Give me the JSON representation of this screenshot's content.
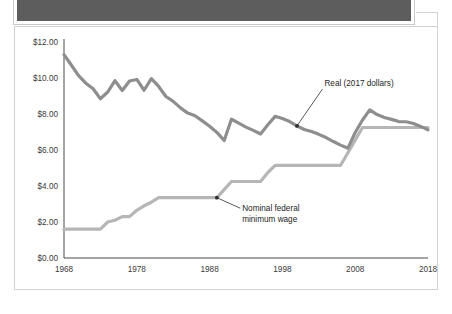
{
  "banner": {
    "name": "top-banner",
    "fill_color": "#5d5d5d",
    "border_color": "#ffffff"
  },
  "chart_data": {
    "type": "line",
    "title": "",
    "xlabel": "",
    "ylabel": "",
    "grid": false,
    "legend_position": "inline-annotations",
    "xlim": [
      1968,
      2018
    ],
    "ylim": [
      0,
      12
    ],
    "x_ticks": [
      1968,
      1978,
      1988,
      1998,
      2008,
      2018
    ],
    "x_tick_labels": [
      "1968",
      "1978",
      "1988",
      "1998",
      "2008",
      "2018"
    ],
    "y_ticks": [
      0,
      2,
      4,
      6,
      8,
      10,
      12
    ],
    "y_tick_labels": [
      "$0.00",
      "$2.00",
      "$4.00",
      "$6.00",
      "$8.00",
      "$10.00",
      "$12.00"
    ],
    "series": [
      {
        "name": "Real (2017 dollars)",
        "color": "#8e8e8e",
        "x": [
          1968,
          1969,
          1970,
          1971,
          1972,
          1973,
          1974,
          1975,
          1976,
          1977,
          1978,
          1979,
          1980,
          1981,
          1982,
          1983,
          1984,
          1985,
          1986,
          1987,
          1988,
          1989,
          1990,
          1991,
          1992,
          1993,
          1994,
          1995,
          1996,
          1997,
          1998,
          1999,
          2000,
          2001,
          2002,
          2003,
          2004,
          2005,
          2006,
          2007,
          2008,
          2009,
          2010,
          2011,
          2012,
          2013,
          2014,
          2015,
          2016,
          2017,
          2018
        ],
        "values": [
          11.3,
          10.72,
          10.13,
          9.71,
          9.4,
          8.85,
          9.22,
          9.85,
          9.31,
          9.83,
          9.92,
          9.32,
          9.96,
          9.53,
          8.97,
          8.7,
          8.34,
          8.05,
          7.9,
          7.62,
          7.32,
          6.98,
          6.53,
          7.71,
          7.49,
          7.27,
          7.09,
          6.89,
          7.4,
          7.87,
          7.75,
          7.58,
          7.34,
          7.14,
          7.03,
          6.87,
          6.69,
          6.47,
          6.27,
          6.1,
          6.97,
          7.67,
          8.23,
          7.97,
          7.81,
          7.7,
          7.58,
          7.57,
          7.47,
          7.31,
          7.12
        ]
      },
      {
        "name": "Nominal federal minimum wage",
        "color": "#b6b6b6",
        "x": [
          1968,
          1969,
          1970,
          1971,
          1972,
          1973,
          1974,
          1975,
          1976,
          1977,
          1978,
          1979,
          1980,
          1981,
          1982,
          1983,
          1984,
          1985,
          1986,
          1987,
          1988,
          1989,
          1990,
          1991,
          1992,
          1993,
          1994,
          1995,
          1996,
          1997,
          1998,
          1999,
          2000,
          2001,
          2002,
          2003,
          2004,
          2005,
          2006,
          2007,
          2008,
          2009,
          2010,
          2011,
          2012,
          2013,
          2014,
          2015,
          2016,
          2017,
          2018
        ],
        "values": [
          1.6,
          1.6,
          1.6,
          1.6,
          1.6,
          1.6,
          2.0,
          2.1,
          2.3,
          2.3,
          2.65,
          2.9,
          3.1,
          3.35,
          3.35,
          3.35,
          3.35,
          3.35,
          3.35,
          3.35,
          3.35,
          3.35,
          3.8,
          4.25,
          4.25,
          4.25,
          4.25,
          4.25,
          4.75,
          5.15,
          5.15,
          5.15,
          5.15,
          5.15,
          5.15,
          5.15,
          5.15,
          5.15,
          5.15,
          5.85,
          6.55,
          7.25,
          7.25,
          7.25,
          7.25,
          7.25,
          7.25,
          7.25,
          7.25,
          7.25,
          7.25
        ]
      }
    ],
    "annotations": [
      {
        "name": "real-series-annotation",
        "text": "Real (2017 dollars)",
        "point_x": 2000,
        "point_y": 7.34,
        "label_x": 2003.5,
        "label_y": 9.55
      },
      {
        "name": "nominal-series-annotation",
        "line1": "Nominal federal",
        "line2": "minimum wage",
        "point_x": 1989,
        "point_y": 3.35,
        "label_x": 1992.2,
        "label_y": 2.6
      }
    ]
  }
}
